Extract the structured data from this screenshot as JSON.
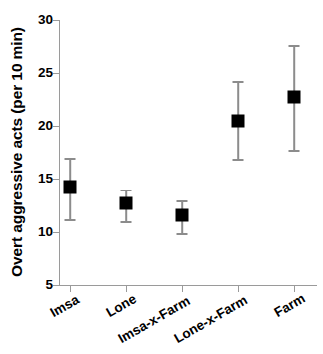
{
  "chart_data": {
    "type": "scatter",
    "title": "",
    "xlabel": "",
    "ylabel": "Overt aggressive acts (per 10 min)",
    "categories": [
      "Imsa",
      "Lone",
      "Imsa-x-Farm",
      "Lone-x-Farm",
      "Farm"
    ],
    "values": [
      14.2,
      12.7,
      11.6,
      20.5,
      22.7
    ],
    "error_upper": [
      17.0,
      14.0,
      13.0,
      24.2,
      27.6
    ],
    "error_lower": [
      11.2,
      11.0,
      9.9,
      16.9,
      17.7
    ],
    "yticks": [
      5,
      10,
      15,
      20,
      25,
      30
    ],
    "ytick_labels": [
      "5",
      "10",
      "15",
      "20",
      "25",
      "30"
    ],
    "ylim": [
      5,
      30
    ],
    "grid": false,
    "legend": null,
    "marker_style": "filled-square",
    "marker_color": "#000000",
    "errorbar_color": "#8c8c8c",
    "axis_color": "#9a9a9a",
    "background_color": "#ffffff",
    "xlabel_rotation": -30
  }
}
